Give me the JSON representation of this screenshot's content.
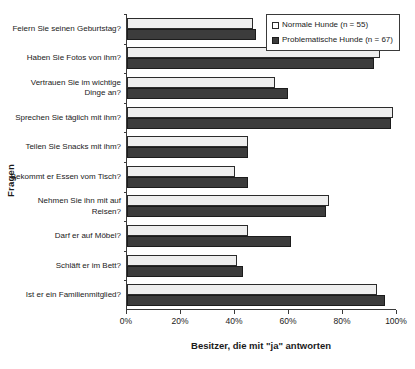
{
  "chart_data": {
    "type": "bar",
    "orientation": "horizontal",
    "title": "",
    "xlabel": "Besitzer, die mit \"ja\" antworten",
    "ylabel": "Fragen",
    "xlim": [
      0,
      100
    ],
    "xticks": [
      0,
      20,
      40,
      60,
      80,
      100
    ],
    "xtick_labels": [
      "0%",
      "20%",
      "40%",
      "60%",
      "80%",
      "100%"
    ],
    "grid": false,
    "legend_position": "top-right",
    "categories": [
      "Feiern Sie seinen Geburtstag?",
      "Haben Sie Fotos von ihm?",
      "Vertrauen Sie im wichtige Dinge an?",
      "Sprechen Sie täglich mit ihm?",
      "Teilen Sie Snacks mit ihm?",
      "Bekommt er Essen vom Tisch?",
      "Nehmen Sie ihn mit auf Reisen?",
      "Darf er auf Möbel?",
      "Schläft er im Bett?",
      "Ist er ein Familienmitglied?"
    ],
    "series": [
      {
        "name": "Normale Hunde (n = 55)",
        "color": "#eeeeee",
        "values": [
          47,
          94,
          55,
          99,
          45,
          40,
          75,
          45,
          41,
          93
        ]
      },
      {
        "name": "Problematische Hunde (n = 67)",
        "color": "#3c3c3c",
        "values": [
          48,
          92,
          60,
          98,
          45,
          45,
          74,
          61,
          43,
          96
        ]
      }
    ]
  },
  "axes": {
    "y_title": "Fragen",
    "x_title": "Besitzer, die mit \"ja\" antworten"
  },
  "legend": {
    "entries": [
      {
        "label": "Normale Hunde (n = 55)"
      },
      {
        "label": "Problematische Hunde (n = 67)"
      }
    ]
  }
}
